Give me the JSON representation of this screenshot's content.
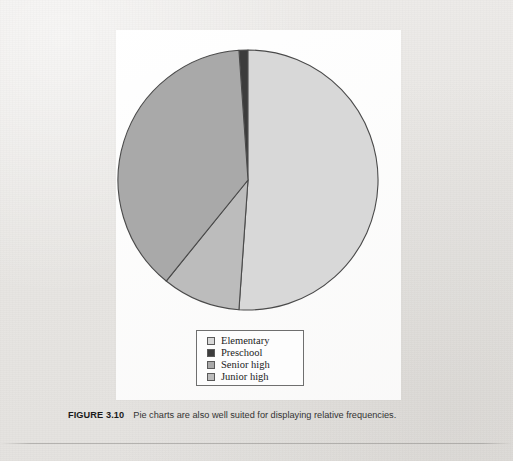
{
  "figure": {
    "caption_label": "FIGURE 3.10",
    "caption_text": "Pie charts are also well suited for displaying relative frequencies."
  },
  "legend": {
    "items": [
      {
        "label": "Elementary",
        "color": "#d8d8d8"
      },
      {
        "label": "Preschool",
        "color": "#3c3c3c"
      },
      {
        "label": "Senior high",
        "color": "#a9a9a9"
      },
      {
        "label": "Junior high",
        "color": "#bcbcbc"
      }
    ]
  },
  "chart_data": {
    "type": "pie",
    "title": "",
    "subtitle": "",
    "xlabel": "",
    "ylabel": "",
    "grid": false,
    "legend_position": "bottom",
    "start_angle_deg": -4,
    "direction": "clockwise",
    "center_px": [
      248,
      180
    ],
    "radius_px": 130,
    "stroke_color": "#4a4a4a",
    "categories": [
      "Preschool",
      "Elementary",
      "Junior high",
      "Senior high"
    ],
    "values": [
      3,
      68,
      10,
      19
    ],
    "unit": "percent",
    "slices": [
      {
        "label": "Preschool",
        "value": 3,
        "color": "#3c3c3c",
        "start_deg": -4,
        "end_deg": 0
      },
      {
        "label": "Elementary",
        "value": 68,
        "color": "#d8d8d8",
        "start_deg": 0,
        "end_deg": 184
      },
      {
        "label": "Junior high",
        "value": 10,
        "color": "#bcbcbc",
        "start_deg": 184,
        "end_deg": 219
      },
      {
        "label": "Senior high",
        "value": 19,
        "color": "#a9a9a9",
        "start_deg": 219,
        "end_deg": 356
      }
    ]
  }
}
